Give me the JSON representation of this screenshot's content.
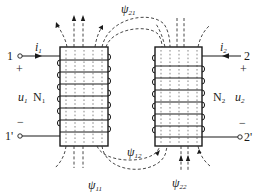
{
  "diagram": {
    "type": "coupled-inductors",
    "colors": {
      "line": "#1a1a1a",
      "background": "#ffffff"
    },
    "coil1": {
      "terminal_top": "1",
      "terminal_bottom": "1'",
      "current": "i",
      "current_sub": "1",
      "voltage": "u",
      "voltage_sub": "1",
      "turns": "N",
      "turns_sub": "1",
      "plus": "+",
      "minus": "−"
    },
    "coil2": {
      "terminal_top": "2",
      "terminal_bottom": "2'",
      "current": "i",
      "current_sub": "2",
      "voltage": "u",
      "voltage_sub": "2",
      "turns": "N",
      "turns_sub": "2",
      "plus": "+",
      "minus": "−"
    },
    "flux_labels": {
      "psi21": {
        "symbol": "ψ",
        "sub": "21"
      },
      "psi12": {
        "symbol": "ψ",
        "sub": "12"
      },
      "psi11": {
        "symbol": "ψ",
        "sub": "11"
      },
      "psi22": {
        "symbol": "ψ",
        "sub": "22"
      }
    }
  }
}
